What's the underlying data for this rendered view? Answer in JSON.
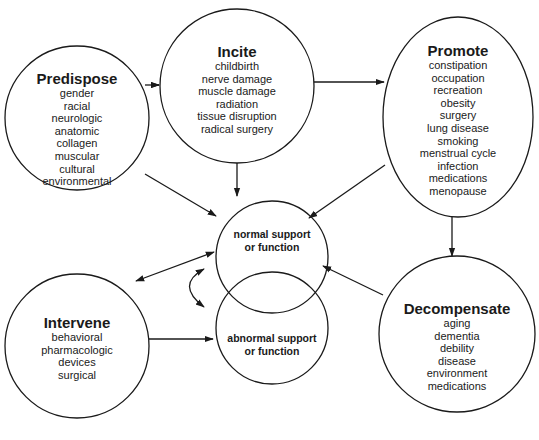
{
  "diagram": {
    "nodes": {
      "predispose": {
        "title": "Predispose",
        "items": [
          "gender",
          "racial",
          "neurologic",
          "anatomic",
          "collagen",
          "muscular",
          "cultural",
          "environmental"
        ]
      },
      "incite": {
        "title": "Incite",
        "items": [
          "childbirth",
          "nerve damage",
          "muscle damage",
          "radiation",
          "tissue disruption",
          "radical surgery"
        ]
      },
      "promote": {
        "title": "Promote",
        "items": [
          "constipation",
          "occupation",
          "recreation",
          "obesity",
          "surgery",
          "lung disease",
          "smoking",
          "menstrual cycle",
          "infection",
          "medications",
          "menopause"
        ]
      },
      "intervene": {
        "title": "Intervene",
        "items": [
          "behavioral",
          "pharmacologic",
          "devices",
          "surgical"
        ]
      },
      "decompensate": {
        "title": "Decompensate",
        "items": [
          "aging",
          "dementia",
          "debility",
          "disease",
          "environment",
          "medications"
        ]
      },
      "normal": {
        "line1": "normal support",
        "line2": "or function"
      },
      "abnormal": {
        "line1": "abnormal support",
        "line2": "or function"
      }
    },
    "edges": [
      {
        "from": "Predispose",
        "to": "Incite"
      },
      {
        "from": "Incite",
        "to": "Promote"
      },
      {
        "from": "Predispose",
        "to": "normal support or function"
      },
      {
        "from": "Incite",
        "to": "normal support or function"
      },
      {
        "from": "Promote",
        "to": "normal support or function"
      },
      {
        "from": "Promote",
        "to": "Decompensate"
      },
      {
        "from": "Decompensate",
        "to": "normal support or function"
      },
      {
        "from": "Intervene",
        "to": "normal support or function",
        "bidirectional": true
      },
      {
        "from": "Intervene",
        "to": "abnormal support or function"
      },
      {
        "from": "normal support or function",
        "to": "abnormal support or function",
        "bidirectional": true
      }
    ]
  }
}
